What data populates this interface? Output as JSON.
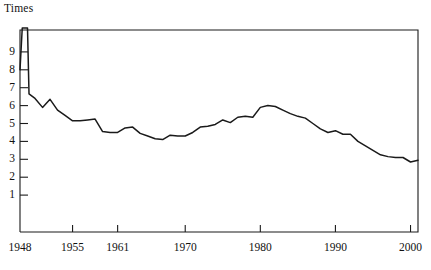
{
  "chart_data": {
    "type": "line",
    "title": "",
    "subtitle": "",
    "ylabel": "Times",
    "xlabel": "",
    "grid": false,
    "legend": "none",
    "xlim": [
      1948,
      2001
    ],
    "ylim": [
      0,
      10.2
    ],
    "yticks": [
      1,
      2,
      3,
      4,
      5,
      6,
      7,
      8,
      9
    ],
    "ytick_labels": [
      "1",
      "2",
      "3",
      "4",
      "5",
      "6",
      "7",
      "8",
      "9"
    ],
    "xticks": [
      1948,
      1955,
      1961,
      1970,
      1980,
      1990,
      2000
    ],
    "xtick_labels": [
      "1948",
      "1955",
      "1961",
      "1970",
      "1980",
      "1990",
      "2000"
    ],
    "annotations": [
      "Line exceeds the top of the plot frame between 1948 and 1949 (off-scale spike)."
    ],
    "series": [
      {
        "name": "Times",
        "color": "#1a1a1a",
        "x": [
          1948,
          1948.3,
          1949,
          1949.2,
          1950,
          1951,
          1952,
          1953,
          1954,
          1955,
          1956,
          1957,
          1958,
          1959,
          1960,
          1961,
          1962,
          1963,
          1964,
          1965,
          1966,
          1967,
          1968,
          1969,
          1970,
          1971,
          1972,
          1973,
          1974,
          1975,
          1976,
          1977,
          1978,
          1979,
          1980,
          1981,
          1982,
          1983,
          1984,
          1985,
          1986,
          1987,
          1988,
          1989,
          1990,
          1991,
          1992,
          1993,
          1994,
          1995,
          1996,
          1997,
          1998,
          1999,
          2000,
          2001
        ],
        "y": [
          8.0,
          11.2,
          11.2,
          6.65,
          6.4,
          5.9,
          6.35,
          5.75,
          5.45,
          5.15,
          5.15,
          5.2,
          5.25,
          4.55,
          4.5,
          4.5,
          4.75,
          4.8,
          4.45,
          4.3,
          4.15,
          4.1,
          4.35,
          4.3,
          4.3,
          4.5,
          4.8,
          4.85,
          4.95,
          5.2,
          5.05,
          5.35,
          5.4,
          5.35,
          5.9,
          6.0,
          5.95,
          5.75,
          5.55,
          5.4,
          5.3,
          5.0,
          4.7,
          4.5,
          4.6,
          4.4,
          4.4,
          4.0,
          3.75,
          3.5,
          3.25,
          3.15,
          3.1,
          3.1,
          2.85,
          2.95
        ]
      }
    ]
  },
  "geometry": {
    "plot_left": 20,
    "plot_right": 418,
    "plot_top": 30,
    "plot_bottom": 232,
    "y_value_at_top_px": 10.2,
    "y_unit_px": 17.9,
    "y_zero_px": 213.0,
    "x_1948_px": 20,
    "x_per_year_px": 7.51
  }
}
